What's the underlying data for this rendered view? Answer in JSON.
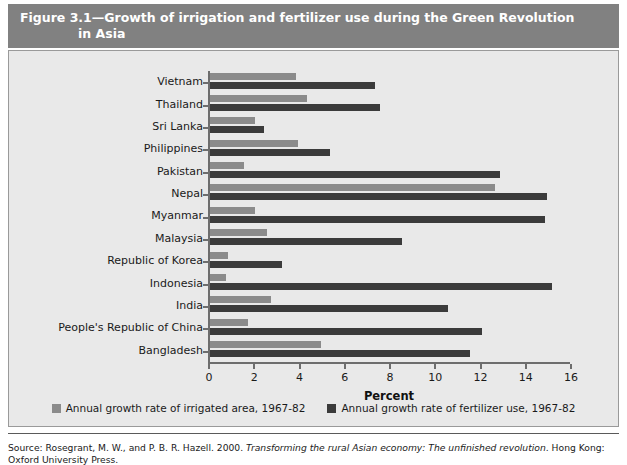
{
  "figure": {
    "title_line1": "Figure 3.1—Growth of irrigation and fertilizer use during the Green Revolution",
    "title_line2": "in Asia",
    "source_line1": "Source: Rosegrant, M. W., and P. B. R. Hazell. 2000. ",
    "source_italic": "Transforming the rural Asian economy: The unfinished revolution",
    "source_line1_tail": ". Hong Kong:",
    "source_line2": "Oxford University Press."
  },
  "colors": {
    "header_bg": "#818181",
    "panel_bg": "#e9e9e9",
    "irrigated": "#8b8b8b",
    "fertilizer": "#3b3b3b",
    "axis": "#6d6d6d"
  },
  "chart_data": {
    "type": "bar",
    "orientation": "horizontal",
    "title": "Figure 3.1—Growth of irrigation and fertilizer use during the Green Revolution in Asia",
    "xlabel": "Percent",
    "ylabel": "",
    "xlim": [
      0,
      16
    ],
    "xticks": [
      0,
      2,
      4,
      6,
      8,
      10,
      12,
      14,
      16
    ],
    "xtick_labels": [
      "0",
      "2",
      "4",
      "6",
      "8",
      "10",
      "12",
      "14",
      "16"
    ],
    "grid": false,
    "legend_position": "bottom",
    "categories": [
      "Vietnam",
      "Thailand",
      "Sri Lanka",
      "Philippines",
      "Pakistan",
      "Nepal",
      "Myanmar",
      "Malaysia",
      "Republic of Korea",
      "Indonesia",
      "India",
      "People's Republic of China",
      "Bangladesh"
    ],
    "series": [
      {
        "name": "Annual growth rate of irrigated area, 1967-82",
        "color": "#8b8b8b",
        "values": [
          3.8,
          4.3,
          2.0,
          3.9,
          1.5,
          12.6,
          2.0,
          2.5,
          0.8,
          0.7,
          2.7,
          1.7,
          4.9
        ]
      },
      {
        "name": "Annual growth rate of fertilizer use, 1967-82",
        "color": "#3b3b3b",
        "values": [
          7.3,
          7.5,
          2.4,
          5.3,
          12.8,
          14.9,
          14.8,
          8.5,
          3.2,
          15.1,
          10.5,
          12.0,
          11.5
        ]
      }
    ]
  }
}
